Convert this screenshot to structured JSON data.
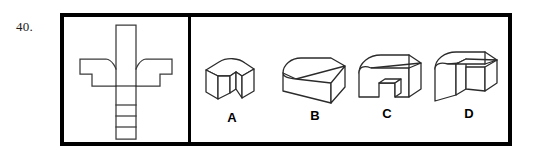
{
  "question": {
    "number": "40."
  },
  "colors": {
    "frame": "#000000",
    "line": "#3a3a3a",
    "background": "#ffffff",
    "label": "#000000"
  },
  "left_panel": {
    "name": "orthographic-view-panel",
    "description": "front-view line drawing of the solid: a tall vertical stem with a wide flared collar and a segmented lower shaft"
  },
  "right_panel": {
    "name": "answer-options-panel",
    "options": [
      {
        "label": "A",
        "name": "option-a",
        "description": "block with rounded back-left top corner and a vertical slot notch cut into the front-right face"
      },
      {
        "label": "B",
        "name": "option-b",
        "description": "solid rectangular block with a rounded chamfer along the front-left vertical edge"
      },
      {
        "label": "C",
        "name": "option-c",
        "description": "arch-shaped block: rounded left shoulder with a rectangular notch cut out of the bottom front face"
      },
      {
        "label": "D",
        "name": "option-d",
        "description": "L-shaped stepped block with a rounded top-left corner and a recessed right section"
      }
    ]
  }
}
